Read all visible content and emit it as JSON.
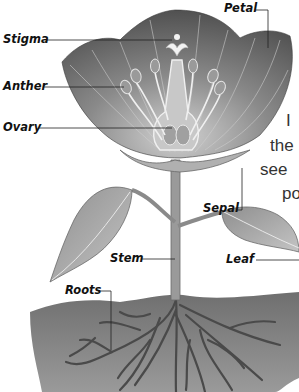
{
  "diagram": {
    "labels": {
      "petal": "Petal",
      "stigma": "Stigma",
      "anther": "Anther",
      "ovary": "Ovary",
      "sepal": "Sepal",
      "stem": "Stem",
      "leaf": "Leaf",
      "roots": "Roots"
    },
    "side_text_fragments": [
      "I",
      "the",
      "see",
      "po"
    ],
    "colors": {
      "petal_dark": "#4a4a4a",
      "petal_light": "#b8b8b8",
      "stem": "#9a9a9a",
      "leaf": "#a8a8a8",
      "soil": "#7c7c7c",
      "roots": "#505050",
      "label_text": "#111111"
    }
  }
}
